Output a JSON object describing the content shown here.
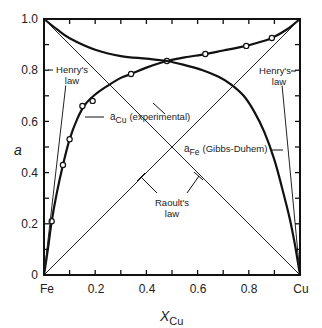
{
  "chart_data": {
    "type": "line",
    "title": "",
    "xlabel": "X_Cu",
    "xlabel_main": "X",
    "xlabel_sub": "Cu",
    "ylabel": "a",
    "xlim": [
      0,
      1
    ],
    "ylim": [
      0,
      1
    ],
    "x_ticks": [
      "Fe",
      "0.2",
      "0.4",
      "0.6",
      "0.8",
      "Cu"
    ],
    "y_ticks": [
      "0",
      "0.2",
      "0.4",
      "0.6",
      "0.8",
      "1.0"
    ],
    "grid": false,
    "series": [
      {
        "name": "a_Cu (experimental)",
        "kind": "curve_with_markers",
        "markers": [
          [
            0.03,
            0.21
          ],
          [
            0.074,
            0.43
          ],
          [
            0.1,
            0.53
          ],
          [
            0.15,
            0.66
          ],
          [
            0.19,
            0.68
          ],
          [
            0.34,
            0.785
          ],
          [
            0.48,
            0.836
          ],
          [
            0.63,
            0.863
          ],
          [
            0.79,
            0.895
          ],
          [
            0.89,
            0.926
          ]
        ],
        "curve": [
          [
            0,
            0
          ],
          [
            0.015,
            0.1
          ],
          [
            0.03,
            0.21
          ],
          [
            0.05,
            0.32
          ],
          [
            0.074,
            0.43
          ],
          [
            0.1,
            0.53
          ],
          [
            0.13,
            0.61
          ],
          [
            0.16,
            0.665
          ],
          [
            0.2,
            0.705
          ],
          [
            0.25,
            0.74
          ],
          [
            0.3,
            0.77
          ],
          [
            0.34,
            0.785
          ],
          [
            0.4,
            0.81
          ],
          [
            0.48,
            0.836
          ],
          [
            0.55,
            0.85
          ],
          [
            0.63,
            0.863
          ],
          [
            0.7,
            0.877
          ],
          [
            0.79,
            0.895
          ],
          [
            0.85,
            0.912
          ],
          [
            0.89,
            0.926
          ],
          [
            0.95,
            0.96
          ],
          [
            1.0,
            1.0
          ]
        ]
      },
      {
        "name": "a_Fe (Gibbs-Duhem)",
        "kind": "curve",
        "curve": [
          [
            0,
            1.0
          ],
          [
            0.05,
            0.96
          ],
          [
            0.1,
            0.925
          ],
          [
            0.2,
            0.88
          ],
          [
            0.3,
            0.855
          ],
          [
            0.4,
            0.845
          ],
          [
            0.48,
            0.836
          ],
          [
            0.55,
            0.82
          ],
          [
            0.62,
            0.8
          ],
          [
            0.68,
            0.775
          ],
          [
            0.73,
            0.745
          ],
          [
            0.78,
            0.7
          ],
          [
            0.82,
            0.64
          ],
          [
            0.86,
            0.56
          ],
          [
            0.9,
            0.45
          ],
          [
            0.93,
            0.34
          ],
          [
            0.96,
            0.22
          ],
          [
            0.98,
            0.12
          ],
          [
            0.99,
            0.06
          ],
          [
            1.0,
            0
          ]
        ]
      },
      {
        "name": "Raoult's law (Cu)",
        "kind": "straight",
        "curve": [
          [
            0,
            0
          ],
          [
            1,
            1
          ]
        ]
      },
      {
        "name": "Raoult's law (Fe)",
        "kind": "straight",
        "curve": [
          [
            0,
            1
          ],
          [
            1,
            0
          ]
        ]
      },
      {
        "name": "Henry's law (Cu)",
        "kind": "straight",
        "curve": [
          [
            0,
            0
          ],
          [
            0.085,
            0.74
          ]
        ]
      },
      {
        "name": "Henry's law (Fe)",
        "kind": "straight",
        "curve": [
          [
            1,
            0
          ],
          [
            0.93,
            0.74
          ]
        ]
      }
    ],
    "annotations": [
      {
        "text": "Henry's law",
        "line1": "Henry's",
        "line2": "law",
        "position": "upper-left"
      },
      {
        "text": "Henry's law",
        "line1": "Henry's",
        "line2": "law",
        "position": "upper-right"
      },
      {
        "text": "a_Cu (experimental)",
        "main": "a",
        "sub": "Cu",
        "rest": "(experimental)"
      },
      {
        "text": "a_Fe (Gibbs-Duhem)",
        "main": "a",
        "sub": "Fe",
        "rest": "(Gibbs-Duhem)"
      },
      {
        "text": "Raoult's law",
        "line1": "Raoult's",
        "line2": "law"
      }
    ]
  }
}
